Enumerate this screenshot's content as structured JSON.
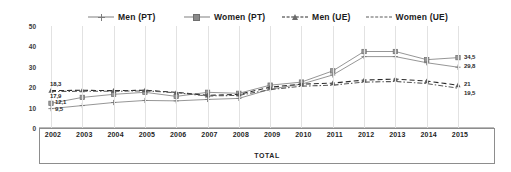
{
  "chart": {
    "xlabel": "TOTAL",
    "ylabel": ""
  },
  "legend": [
    {
      "label": "Men (PT)",
      "marker": "plus-marker",
      "style": "solid"
    },
    {
      "label": "Women (PT)",
      "marker": "square-marker",
      "style": "solid"
    },
    {
      "label": "Men (UE)",
      "marker": "triangle-marker",
      "style": "dashed"
    },
    {
      "label": "Women (UE)",
      "marker": "no-marker",
      "style": "dash-dot"
    }
  ],
  "yticks": [
    "50",
    "40",
    "30",
    "20",
    "10",
    "0"
  ],
  "end_labels": {
    "men_pt": "29,8",
    "women_pt": "34,5",
    "men_ue": "21",
    "women_ue": "19,5"
  },
  "start_labels": {
    "men_ue": "18,3",
    "women_ue": "17,9",
    "women_pt": "12,1",
    "men_pt": "9,5"
  },
  "chart_data": {
    "type": "line",
    "title": "",
    "xlabel": "TOTAL",
    "ylabel": "",
    "ylim": [
      0,
      50
    ],
    "grid": true,
    "legend_position": "top",
    "categories": [
      "2002",
      "2003",
      "2004",
      "2005",
      "2006",
      "2007",
      "2008",
      "2009",
      "2010",
      "2011",
      "2012",
      "2013",
      "2014",
      "2015"
    ],
    "series": [
      {
        "name": "Men (PT)",
        "marker": "plus",
        "linestyle": "solid",
        "color": "#8a8a8a",
        "values": [
          9.5,
          11.0,
          12.5,
          13.5,
          13.3,
          14.0,
          14.5,
          19.0,
          21.5,
          26.0,
          35.0,
          35.0,
          32.0,
          29.8
        ]
      },
      {
        "name": "Women (PT)",
        "marker": "square",
        "linestyle": "solid",
        "color": "#8a8a8a",
        "values": [
          12.1,
          15.0,
          16.5,
          17.5,
          15.5,
          17.5,
          17.0,
          21.0,
          22.5,
          28.0,
          37.5,
          37.5,
          33.5,
          34.5
        ]
      },
      {
        "name": "Men (UE)",
        "marker": "triangle",
        "linestyle": "dashed",
        "color": "#2b2b2b",
        "values": [
          18.3,
          18.5,
          18.3,
          18.5,
          17.5,
          16.0,
          16.5,
          20.0,
          21.5,
          22.0,
          23.5,
          24.0,
          23.0,
          21.0
        ]
      },
      {
        "name": "Women (UE)",
        "marker": "none",
        "linestyle": "dash-dot",
        "color": "#5a5a5a",
        "values": [
          17.9,
          18.0,
          18.0,
          18.2,
          17.3,
          15.7,
          16.0,
          18.8,
          20.5,
          21.0,
          22.5,
          22.8,
          21.8,
          19.5
        ]
      }
    ],
    "endpoint_labels": [
      {
        "series": "Women (PT)",
        "value": "34,5"
      },
      {
        "series": "Men (PT)",
        "value": "29,8"
      },
      {
        "series": "Men (UE)",
        "value": "21"
      },
      {
        "series": "Women (UE)",
        "value": "19,5"
      }
    ],
    "startpoint_labels": [
      {
        "series": "Men (UE)",
        "value": "18,3"
      },
      {
        "series": "Women (UE)",
        "value": "17,9"
      },
      {
        "series": "Women (PT)",
        "value": "12,1"
      },
      {
        "series": "Men (PT)",
        "value": "9,5"
      }
    ]
  }
}
